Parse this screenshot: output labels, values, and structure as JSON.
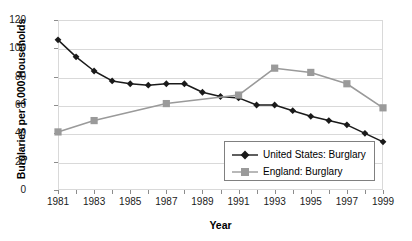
{
  "chart_data": {
    "type": "line",
    "title": "",
    "xlabel": "Year",
    "ylabel": "Burglaries per 1,000 Households",
    "x": [
      1981,
      1982,
      1983,
      1984,
      1985,
      1986,
      1987,
      1988,
      1989,
      1990,
      1991,
      1992,
      1993,
      1994,
      1995,
      1996,
      1997,
      1998,
      1999
    ],
    "xlim": [
      1981,
      1999
    ],
    "ylim": [
      0,
      120
    ],
    "yticks": [
      0,
      20,
      40,
      60,
      80,
      100,
      120
    ],
    "xticks_labeled": [
      1981,
      1983,
      1985,
      1987,
      1989,
      1991,
      1993,
      1995,
      1997,
      1999
    ],
    "xticks_all": [
      1981,
      1982,
      1983,
      1984,
      1985,
      1986,
      1987,
      1988,
      1989,
      1990,
      1991,
      1992,
      1993,
      1994,
      1995,
      1996,
      1997,
      1998,
      1999
    ],
    "grid": true,
    "legend_position": "inside-bottom-right",
    "series": [
      {
        "name": "United States: Burglary",
        "color": "#1a1a1a",
        "marker": "diamond",
        "x": [
          1981,
          1982,
          1983,
          1984,
          1985,
          1986,
          1987,
          1988,
          1989,
          1990,
          1991,
          1992,
          1993,
          1994,
          1995,
          1996,
          1997,
          1998,
          1999
        ],
        "values": [
          106,
          94,
          84,
          77,
          75,
          74,
          75,
          75,
          69,
          66,
          65,
          60,
          60,
          56,
          52,
          49,
          46,
          40,
          34
        ]
      },
      {
        "name": "England: Burglary",
        "color": "#9a9a9a",
        "marker": "square",
        "x": [
          1981,
          1983,
          1987,
          1991,
          1993,
          1995,
          1997,
          1999
        ],
        "values": [
          41,
          49,
          61,
          67,
          86,
          83,
          75,
          58
        ]
      }
    ]
  },
  "axis": {
    "y_title": "Burglaries per 1,000 Households",
    "x_title": "Year",
    "y_tick_labels": [
      "120",
      "100",
      "80",
      "60",
      "40",
      "20",
      "0"
    ],
    "x_tick_labels": [
      "1981",
      "1983",
      "1985",
      "1987",
      "1989",
      "1991",
      "1993",
      "1995",
      "1997",
      "1999"
    ]
  },
  "legend": {
    "items": [
      {
        "label": "United States: Burglary",
        "color": "#1a1a1a",
        "marker": "diamond"
      },
      {
        "label": "England: Burglary",
        "color": "#9a9a9a",
        "marker": "square"
      }
    ]
  },
  "colors": {
    "us_series": "#1a1a1a",
    "england_series": "#9a9a9a",
    "grid": "#d9d9d9",
    "axis_text": "#1a1a1a",
    "plot_border": "#d9d9d9",
    "legend_border": "#808080"
  }
}
